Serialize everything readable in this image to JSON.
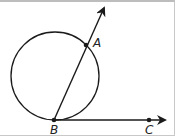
{
  "diagram": {
    "type": "geometry",
    "circle": {
      "cx": 55,
      "cy": 76,
      "r": 44
    },
    "points": [
      {
        "name": "A",
        "x": 86,
        "y": 45,
        "label_x": 93,
        "label_y": 47
      },
      {
        "name": "B",
        "x": 54,
        "y": 120,
        "label_x": 50,
        "label_y": 134
      },
      {
        "name": "C",
        "x": 149,
        "y": 120,
        "label_x": 145,
        "label_y": 134
      }
    ],
    "rays": [
      {
        "name": "ray-BA",
        "from": "B",
        "through": "A",
        "end_x": 104,
        "end_y": 8
      },
      {
        "name": "ray-BC",
        "from": "B",
        "through": "C",
        "end_x": 165,
        "end_y": 120
      }
    ],
    "labels": {
      "A": "A",
      "B": "B",
      "C": "C"
    },
    "stroke_color": "#1a1a1a"
  }
}
